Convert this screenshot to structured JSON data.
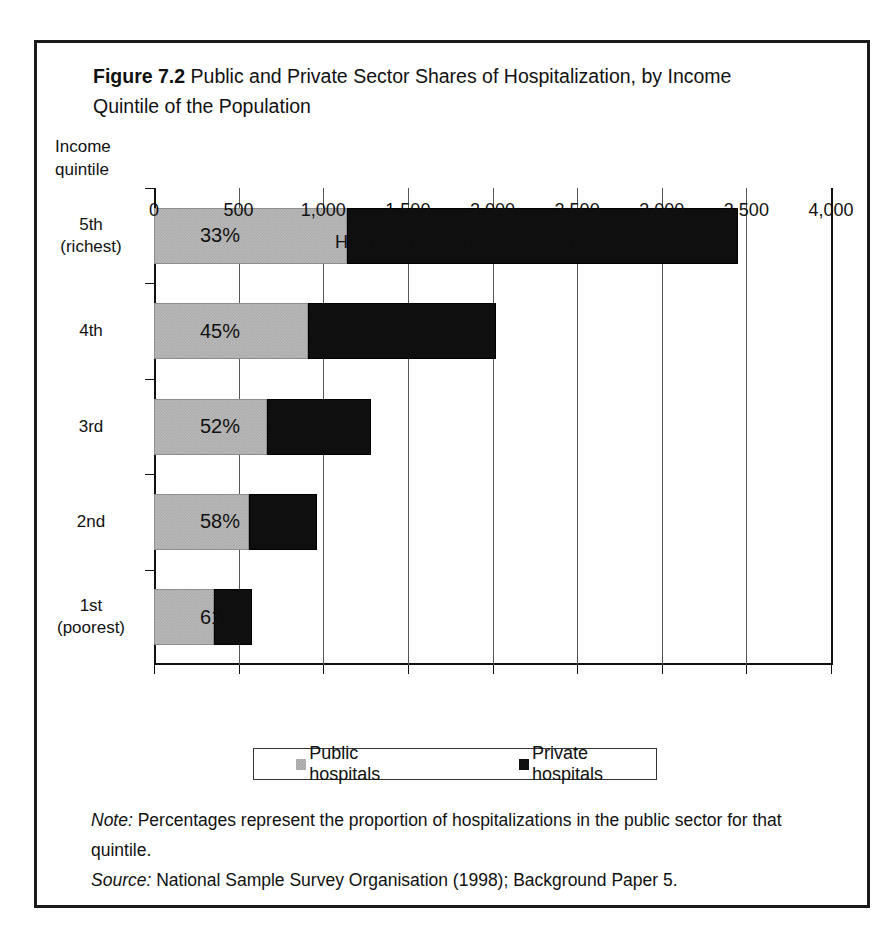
{
  "figure": {
    "number_label": "Figure 7.2",
    "title": "Public and Private Sector Shares of Hospitalization, by Income Quintile of the Population",
    "axis_header_line1": "Income",
    "axis_header_line2": "quintile"
  },
  "legend": {
    "public_label": "Public hospitals",
    "private_label": "Private hospitals",
    "public_color": "#b9b9b9",
    "private_color": "#0f0f0f"
  },
  "footnotes": {
    "note_keyword": "Note:",
    "note_text": " Percentages represent the proportion of hospitalizations in the public sector for that quintile.",
    "source_keyword": "Source:",
    "source_text": " National Sample Survey Organisation (1998); Background Paper 5."
  },
  "chart_data": {
    "type": "bar",
    "orientation": "horizontal",
    "stacked": true,
    "title": "Public and Private Sector Shares of Hospitalization, by Income Quintile of the Population",
    "xlabel": "Hospitalizations per 100,000 population",
    "ylabel": "Income quintile",
    "xlim": [
      0,
      4000
    ],
    "xticks": [
      0,
      500,
      1000,
      1500,
      2000,
      2500,
      3000,
      3500,
      4000
    ],
    "xtick_labels": [
      "0",
      "500",
      "1,000",
      "1,500",
      "2,000",
      "2,500",
      "3,000",
      "3,500",
      "4,000"
    ],
    "grid": true,
    "legend_position": "bottom",
    "categories": [
      "5th\n(richest)",
      "4th",
      "3rd",
      "2nd",
      "1st\n(poorest)"
    ],
    "category_labels": [
      {
        "line1": "5th",
        "line2": "(richest)"
      },
      {
        "line1": "4th",
        "line2": ""
      },
      {
        "line1": "3rd",
        "line2": ""
      },
      {
        "line1": "2nd",
        "line2": ""
      },
      {
        "line1": "1st",
        "line2": "(poorest)"
      }
    ],
    "series": [
      {
        "name": "Public hospitals",
        "values": [
          1139,
          909,
          668,
          560,
          354
        ]
      },
      {
        "name": "Private hospitals",
        "values": [
          2311,
          1111,
          617,
          405,
          226
        ]
      }
    ],
    "totals": [
      3450,
      2020,
      1285,
      965,
      580
    ],
    "annotations": [
      "33%",
      "45%",
      "52%",
      "58%",
      "61%"
    ],
    "public_share_percent": [
      33,
      45,
      52,
      58,
      61
    ]
  }
}
